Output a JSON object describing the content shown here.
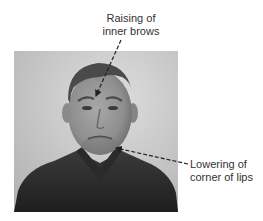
{
  "figure": {
    "image_description": "Grayscale photograph of a man's face showing a sad facial expression",
    "annotations": [
      {
        "id": "inner-brows",
        "line1": "Raising of",
        "line2": "inner brows",
        "points_to": "forehead between brows"
      },
      {
        "id": "lip-corners",
        "line1": "Lowering of",
        "line2": "corner of lips",
        "points_to": "corner of mouth"
      }
    ],
    "colors": {
      "text": "#333333",
      "arrow": "#222222",
      "background": "#ffffff"
    }
  }
}
